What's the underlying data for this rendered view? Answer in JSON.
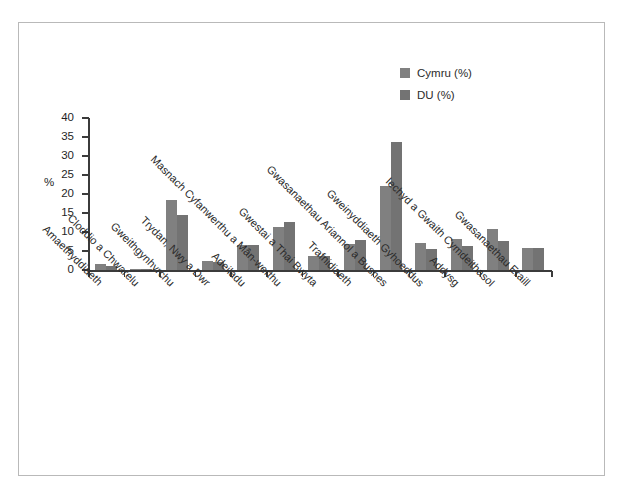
{
  "chart_data": {
    "type": "bar",
    "title": "",
    "subtitle": "",
    "xlabel": "",
    "ylabel": "%",
    "ylim": [
      0,
      40
    ],
    "yticks": [
      "0",
      "5",
      "10",
      "15",
      "20",
      "25",
      "30",
      "35",
      "40"
    ],
    "grid": false,
    "legend_position": "top-right",
    "categories": [
      "Amaethyddiaeth",
      "Cloddio a Chwarelu",
      "Gweithgynhyrchu",
      "Trydan, Nwy a Dwr",
      "Adeiladu",
      "Masnach Cyfanwerthu a Mân-werthu",
      "Gwestai a Thai Bwyta",
      "Trafnidiaeth",
      "Gwasanaethau Ariannol a Busnes",
      "Gweinyddiaeth Gyhoeddus",
      "Addysg",
      "Iechyd a Gwaith Cymdeithasol",
      "Gwasanaethau Eraill"
    ],
    "series": [
      {
        "name": "Cymru (%)",
        "color": "#808080",
        "values": [
          1.7,
          0.2,
          18.5,
          2.3,
          6.5,
          11.3,
          3.6,
          6.8,
          22.0,
          7.0,
          8.1,
          10.9,
          5.9
        ]
      },
      {
        "name": "DU (%)",
        "color": "#737373",
        "values": [
          1.0,
          0.2,
          14.5,
          2.0,
          6.5,
          12.7,
          3.6,
          7.9,
          33.8,
          5.6,
          6.2,
          7.7,
          5.9
        ]
      }
    ]
  },
  "legend": {
    "items": [
      {
        "label": "Cymru (%)",
        "color": "#808080"
      },
      {
        "label": "DU (%)",
        "color": "#737373"
      }
    ]
  },
  "axis": {
    "y_title": "%"
  }
}
